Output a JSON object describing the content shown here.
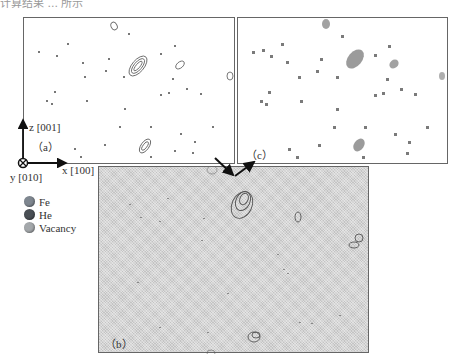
{
  "caption_top": "计算结果 ... 所示",
  "panels": {
    "a": {
      "label": "（a）"
    },
    "b": {
      "label": "（b）"
    },
    "c": {
      "label": "（c）"
    }
  },
  "axes": {
    "z": "z [001]",
    "x": "x [100]",
    "y": "y [010]"
  },
  "legend": [
    {
      "label": "Fe",
      "color": "#7f8790"
    },
    {
      "label": "He",
      "color": "#4a4f55"
    },
    {
      "label": "Vacancy",
      "color": "#a4a8ab"
    }
  ],
  "colors": {
    "cluster": "#6a6a6a",
    "panel_border": "#666666",
    "panel_b_background": "#d4d4d4",
    "arrow": "#111111"
  }
}
